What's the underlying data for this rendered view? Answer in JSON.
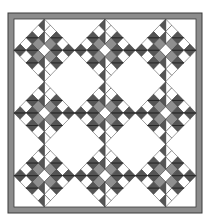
{
  "quilt": {
    "name": "Nine-block diamond quilt pattern",
    "layout": {
      "rows": 3,
      "cols": 3,
      "setting": "on-point blocks with white setting squares",
      "has_border": true
    },
    "colors": {
      "background": "#ffffff",
      "border_fill": "#8c8c8c",
      "outline": "#3a3a3a",
      "dark": "#555555",
      "medium": "#8f8f8f",
      "light": "#ffffff"
    },
    "block_grid": [
      [
        "D",
        "W",
        "D",
        "W",
        "D"
      ],
      [
        "W",
        "D",
        "M",
        "D",
        "W"
      ],
      [
        "D",
        "M",
        "W",
        "M",
        "D"
      ],
      [
        "W",
        "D",
        "M",
        "D",
        "W"
      ],
      [
        "D",
        "W",
        "D",
        "W",
        "D"
      ]
    ],
    "block_grid_legend": {
      "D": "dark (half-square split)",
      "M": "medium",
      "W": "light"
    }
  }
}
